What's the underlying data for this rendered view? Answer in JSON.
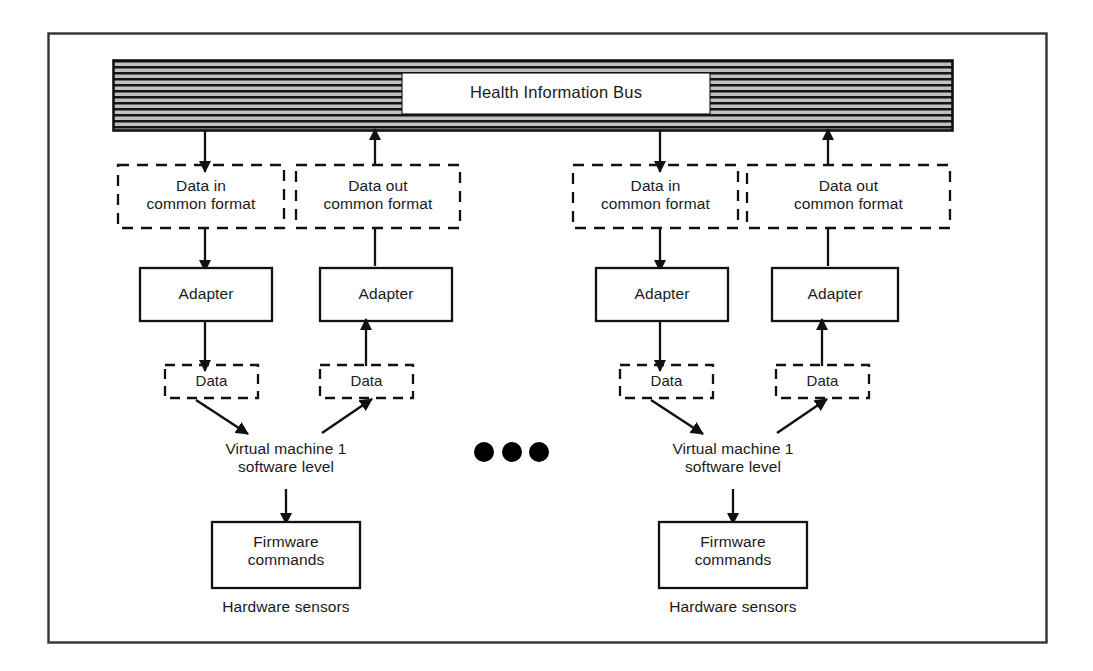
{
  "figure": {
    "frame": {
      "stroke": "#333333"
    },
    "colors": {
      "ink": "#1a1a1a",
      "line": "#111111",
      "bus_fill": "#b4b4b4",
      "bus_hatch": "#141414",
      "paper": "#ffffff"
    }
  },
  "bus": {
    "label": "Health Information Bus",
    "hatch_style": "horizontal-lines"
  },
  "ellipsis": {
    "label": "• • •",
    "dots": 3
  },
  "columns": [
    {
      "id": "col-1",
      "direction": "in",
      "common_format": "Data in\ncommon format",
      "adapter": "Adapter",
      "data": "Data",
      "virtual_machine": "Virtual machine 1\nsoftware level",
      "firmware": "Firmware\ncommands",
      "hardware": "Hardware sensors"
    },
    {
      "id": "col-2",
      "direction": "out",
      "common_format": "Data out\ncommon format",
      "adapter": "Adapter",
      "data": "Data",
      "virtual_machine": null,
      "firmware": null,
      "hardware": null
    },
    {
      "id": "col-3",
      "direction": "in",
      "common_format": "Data in\ncommon format",
      "adapter": "Adapter",
      "data": "Data",
      "virtual_machine": "Virtual machine 1\nsoftware level",
      "firmware": "Firmware\ncommands",
      "hardware": "Hardware sensors"
    },
    {
      "id": "col-4",
      "direction": "out",
      "common_format": "Data out\ncommon format",
      "adapter": "Adapter",
      "data": "Data",
      "virtual_machine": null,
      "firmware": null,
      "hardware": null
    }
  ],
  "groups": [
    {
      "id": "group-left",
      "virtual_machine": "Virtual machine 1\nsoftware level",
      "firmware": "Firmware\ncommands",
      "hardware": "Hardware sensors"
    },
    {
      "id": "group-right",
      "virtual_machine": "Virtual machine 1\nsoftware level",
      "firmware": "Firmware\ncommands",
      "hardware": "Hardware sensors"
    }
  ]
}
